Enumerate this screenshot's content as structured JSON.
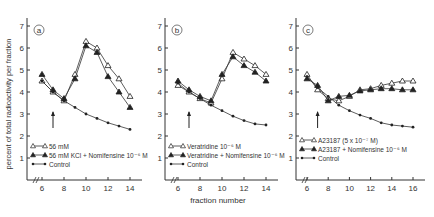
{
  "figure": {
    "ylabel": "percent of total radioactivity per fraction",
    "xlabel": "fraction number"
  },
  "chart_data": [
    {
      "type": "line",
      "panel": "a",
      "xlabel": "",
      "ylabel": "percent of total radioactivity per fraction",
      "xticks": [
        6,
        8,
        10,
        12,
        14
      ],
      "yticks": [
        1,
        2,
        3,
        4,
        5,
        6,
        7
      ],
      "xlim": [
        5,
        15
      ],
      "ylim": [
        0,
        7.5
      ],
      "arrow_x": 7,
      "series": [
        {
          "name": "56 mM",
          "marker": "open-triangle",
          "x": [
            6,
            7,
            8,
            9,
            10,
            11,
            12,
            13,
            14
          ],
          "y": [
            4.5,
            4.0,
            3.6,
            4.8,
            6.3,
            6.0,
            5.2,
            4.6,
            3.8
          ]
        },
        {
          "name": "56 mM KCl + Nomifensine 10^-6 M",
          "marker": "filled-triangle",
          "x": [
            6,
            7,
            8,
            9,
            10,
            11,
            12,
            13,
            14
          ],
          "y": [
            4.8,
            4.1,
            3.7,
            4.6,
            6.1,
            5.8,
            4.7,
            4.0,
            3.3
          ]
        },
        {
          "name": "Control",
          "marker": "dot",
          "x": [
            6,
            7,
            8,
            9,
            10,
            11,
            12,
            13,
            14
          ],
          "y": [
            4.5,
            4.0,
            3.6,
            3.3,
            3.0,
            2.8,
            2.6,
            2.45,
            2.3
          ]
        }
      ]
    },
    {
      "type": "line",
      "panel": "b",
      "xlabel": "fraction number",
      "ylabel": "",
      "xticks": [
        6,
        8,
        10,
        12,
        14
      ],
      "yticks": [
        1,
        2,
        3,
        4,
        5,
        6,
        7
      ],
      "xlim": [
        5,
        15
      ],
      "ylim": [
        0,
        7.5
      ],
      "arrow_x": 7,
      "series": [
        {
          "name": "Veratridine 10^-6 M",
          "marker": "open-triangle",
          "x": [
            6,
            7,
            8,
            9,
            10,
            11,
            12,
            13,
            14
          ],
          "y": [
            4.3,
            4.0,
            3.7,
            3.5,
            4.6,
            5.8,
            5.5,
            5.2,
            4.8
          ]
        },
        {
          "name": "Veratridine + Nomifensine 10^-6 M",
          "marker": "filled-triangle",
          "x": [
            6,
            7,
            8,
            9,
            10,
            11,
            12,
            13,
            14
          ],
          "y": [
            4.5,
            4.1,
            3.8,
            3.6,
            4.8,
            5.6,
            5.2,
            4.9,
            4.5
          ]
        },
        {
          "name": "Control",
          "marker": "dot",
          "x": [
            6,
            7,
            8,
            9,
            10,
            11,
            12,
            13,
            14
          ],
          "y": [
            4.4,
            4.0,
            3.7,
            3.4,
            3.15,
            2.9,
            2.7,
            2.55,
            2.5
          ]
        }
      ]
    },
    {
      "type": "line",
      "panel": "c",
      "xlabel": "",
      "ylabel": "",
      "xticks": [
        6,
        8,
        10,
        12,
        14,
        16
      ],
      "yticks": [
        1,
        2,
        3,
        4,
        5,
        6,
        7
      ],
      "xlim": [
        5,
        17
      ],
      "ylim": [
        0,
        7.5
      ],
      "arrow_x": 7,
      "series": [
        {
          "name": "A23187 (5 x 10^-7 M)",
          "marker": "open-triangle",
          "x": [
            6,
            7,
            8,
            9,
            10,
            11,
            12,
            13,
            14,
            15,
            16
          ],
          "y": [
            4.8,
            4.1,
            3.7,
            3.6,
            3.8,
            4.1,
            4.15,
            4.3,
            4.4,
            4.5,
            4.5
          ]
        },
        {
          "name": "A23187 + Nomifensine 10^-6 M",
          "marker": "filled-triangle",
          "x": [
            6,
            7,
            8,
            9,
            10,
            11,
            12,
            13,
            14,
            15,
            16
          ],
          "y": [
            4.6,
            4.3,
            3.6,
            3.8,
            3.85,
            4.05,
            4.1,
            4.15,
            4.15,
            4.1,
            4.1
          ]
        },
        {
          "name": "Control",
          "marker": "dot",
          "x": [
            6,
            7,
            8,
            9,
            10,
            11,
            12,
            13,
            14,
            15,
            16
          ],
          "y": [
            4.7,
            4.2,
            3.8,
            3.4,
            3.15,
            2.95,
            2.8,
            2.6,
            2.5,
            2.45,
            2.4
          ]
        }
      ]
    }
  ]
}
